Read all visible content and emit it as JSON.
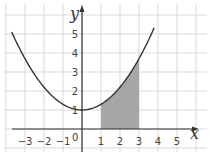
{
  "chart_data": {
    "type": "line",
    "title": "",
    "xlabel": "x",
    "ylabel": "y",
    "xlim": [
      -3.7,
      5.8
    ],
    "ylim": [
      -1.1,
      6.4
    ],
    "grid": true,
    "x_ticks": [
      "-3",
      "-2",
      "-1",
      "1",
      "2",
      "3",
      "4",
      "5"
    ],
    "y_ticks": [
      "1",
      "2",
      "3",
      "4",
      "5"
    ],
    "origin_label": "0",
    "series": [
      {
        "name": "curve",
        "function": "y = 1 + 0.3x^2",
        "x": [
          -3.7,
          -3,
          -2,
          -1,
          0,
          1,
          2,
          3,
          3.8
        ],
        "values": [
          5.1,
          3.7,
          2.2,
          1.3,
          1.0,
          1.3,
          2.2,
          3.7,
          5.3
        ]
      }
    ],
    "shaded_region": {
      "x_from": 1,
      "x_to": 3,
      "below": "curve",
      "above": "x-axis"
    },
    "colors": {
      "curve": "#333333",
      "shade": "#a6a6a6",
      "grid": "#d9d9d9",
      "axis": "#333333"
    }
  }
}
